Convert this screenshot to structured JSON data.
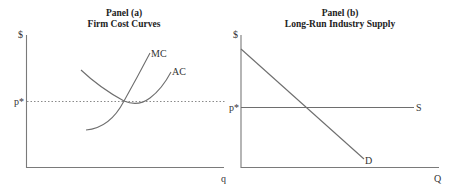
{
  "panels": [
    {
      "id": "a",
      "title": "Panel (a)",
      "subtitle": "Firm Cost Curves",
      "y_axis_label": "$",
      "x_axis_label": "q",
      "price_label": "p*",
      "curves": [
        {
          "name": "MC",
          "label": "MC"
        },
        {
          "name": "AC",
          "label": "AC"
        }
      ]
    },
    {
      "id": "b",
      "title": "Panel (b)",
      "subtitle": "Long-Run Industry Supply",
      "y_axis_label": "$",
      "x_axis_label": "Q",
      "price_label": "p*",
      "curves": [
        {
          "name": "S",
          "label": "S"
        },
        {
          "name": "D",
          "label": "D"
        }
      ]
    }
  ],
  "colors": {
    "axis": "#7a7a7a",
    "curve": "#6e6e6e",
    "text": "#222222"
  }
}
